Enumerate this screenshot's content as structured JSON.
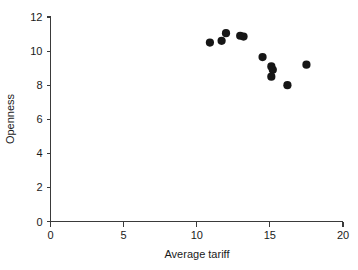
{
  "chart_data": {
    "type": "scatter",
    "title": "",
    "xlabel": "Average tariff",
    "ylabel": "Openness",
    "xlim": [
      0,
      20
    ],
    "ylim": [
      0,
      12
    ],
    "xticks": [
      0,
      5,
      10,
      15,
      20
    ],
    "yticks": [
      0,
      2,
      4,
      6,
      8,
      10,
      12
    ],
    "xtick_labels": [
      "0",
      "5",
      "10",
      "15",
      "20"
    ],
    "ytick_labels": [
      "0",
      "2",
      "4",
      "6",
      "8",
      "10",
      "12"
    ],
    "grid": false,
    "legend": null,
    "marker": {
      "shape": "circle",
      "color": "#161616",
      "size": 4.1
    },
    "series": [
      {
        "name": "observations",
        "points": [
          {
            "x": 10.9,
            "y": 10.5
          },
          {
            "x": 11.7,
            "y": 10.6
          },
          {
            "x": 12.0,
            "y": 11.05
          },
          {
            "x": 12.97,
            "y": 10.9
          },
          {
            "x": 13.2,
            "y": 10.85
          },
          {
            "x": 14.5,
            "y": 9.65
          },
          {
            "x": 15.1,
            "y": 9.1
          },
          {
            "x": 15.2,
            "y": 8.9
          },
          {
            "x": 15.1,
            "y": 8.5
          },
          {
            "x": 16.2,
            "y": 8.0
          },
          {
            "x": 17.5,
            "y": 9.2
          }
        ]
      }
    ]
  },
  "figure": {
    "background_color": "#ffffff",
    "axis_color": "#3a3a3a",
    "text_color": "#1a1a1a"
  }
}
